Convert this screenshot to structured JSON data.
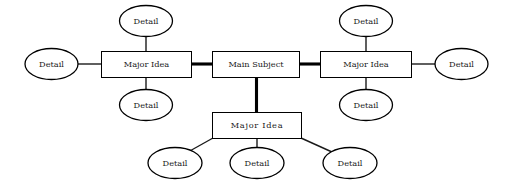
{
  "diagram": {
    "background_color": "#ffffff",
    "stroke_color": "#000000",
    "text_color": "#1a1a1a",
    "nodes": {
      "main_subject": {
        "label": "Main Subject",
        "shape": "rect"
      },
      "major_idea_left": {
        "label": "Major Idea",
        "shape": "rect"
      },
      "major_idea_right": {
        "label": "Major Idea",
        "shape": "rect"
      },
      "major_idea_bottom": {
        "label": "Major  Idea",
        "shape": "rect"
      },
      "detail_left_top": {
        "label": "Detail",
        "shape": "ellipse"
      },
      "detail_left_side": {
        "label": "Detail",
        "shape": "ellipse"
      },
      "detail_left_bottom": {
        "label": "Detail",
        "shape": "ellipse"
      },
      "detail_right_top": {
        "label": "Detail",
        "shape": "ellipse"
      },
      "detail_right_side": {
        "label": "Detail",
        "shape": "ellipse"
      },
      "detail_right_bottom": {
        "label": "Detail",
        "shape": "ellipse"
      },
      "detail_bottom_left": {
        "label": "Detail",
        "shape": "ellipse"
      },
      "detail_bottom_center": {
        "label": "Detail",
        "shape": "ellipse"
      },
      "detail_bottom_right": {
        "label": "Detail",
        "shape": "ellipse"
      }
    }
  }
}
